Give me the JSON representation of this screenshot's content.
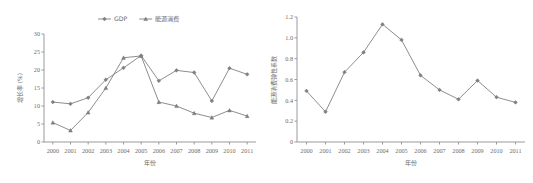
{
  "figure": {
    "background": "#ffffff",
    "line_color": "#808080",
    "axis_color": "#9a9a9a",
    "text_color": "#6d6d6d"
  },
  "chart_data": [
    {
      "type": "line",
      "id": "left",
      "title": "",
      "xlabel": "年份",
      "ylabel": "增长率 (%)",
      "grid": false,
      "legend_position": "top-center",
      "x": [
        "2000",
        "2001",
        "2002",
        "2003",
        "2004",
        "2005",
        "2006",
        "2007",
        "2008",
        "2009",
        "2010",
        "2011"
      ],
      "categories": [
        "2000",
        "2001",
        "2002",
        "2003",
        "2004",
        "2005",
        "2006",
        "2007",
        "2008",
        "2009",
        "2010",
        "2011"
      ],
      "ylim": [
        0,
        30
      ],
      "yticks": [
        "0",
        "5",
        "10",
        "15",
        "20",
        "25",
        "30"
      ],
      "series": [
        {
          "name": "GDP",
          "marker": "diamond",
          "values": [
            11.1,
            10.6,
            12.3,
            17.3,
            20.6,
            24.0,
            17.0,
            19.9,
            19.3,
            11.4,
            20.5,
            18.8
          ]
        },
        {
          "name": "能源消费",
          "marker": "triangle",
          "values": [
            5.4,
            3.2,
            8.2,
            15.0,
            23.4,
            23.9,
            11.1,
            10.0,
            8.0,
            6.8,
            8.8,
            7.2
          ]
        }
      ]
    },
    {
      "type": "line",
      "id": "right",
      "title": "",
      "xlabel": "年份",
      "ylabel": "能源消费弹性系数",
      "grid": false,
      "legend_position": "none",
      "x": [
        "2000",
        "2001",
        "2002",
        "2003",
        "2004",
        "2005",
        "2006",
        "2007",
        "2008",
        "2009",
        "2010",
        "2011"
      ],
      "categories": [
        "2000",
        "2001",
        "2002",
        "2003",
        "2004",
        "2005",
        "2006",
        "2007",
        "2008",
        "2009",
        "2010",
        "2011"
      ],
      "ylim": [
        0,
        1.2
      ],
      "yticks": [
        "0",
        "0.2",
        "0.4",
        "0.6",
        "0.8",
        "1.0",
        "1.2"
      ],
      "series": [
        {
          "name": "能源消费弹性系数",
          "marker": "diamond",
          "values": [
            0.49,
            0.29,
            0.67,
            0.86,
            1.13,
            0.98,
            0.64,
            0.5,
            0.41,
            0.59,
            0.43,
            0.38
          ]
        }
      ]
    }
  ]
}
